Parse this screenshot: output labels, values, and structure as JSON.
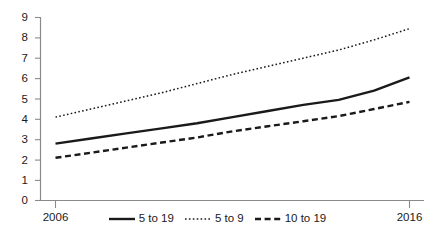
{
  "chart_data": {
    "type": "line",
    "title": "",
    "subtitle": "",
    "xlabel": "",
    "ylabel": "",
    "xlim": [
      2006,
      2016
    ],
    "ylim": [
      0,
      9
    ],
    "grid": false,
    "legend_position": "bottom-center",
    "x": [
      2006,
      2007,
      2008,
      2009,
      2010,
      2011,
      2012,
      2013,
      2014,
      2015,
      2016
    ],
    "x_tick_labels": [
      "2006",
      "2016"
    ],
    "y_tick_labels": [
      "0",
      "1",
      "2",
      "3",
      "4",
      "5",
      "6",
      "7",
      "8",
      "9"
    ],
    "y_ticks": [
      0,
      1,
      2,
      3,
      4,
      5,
      6,
      7,
      8,
      9
    ],
    "series": [
      {
        "name": "5 to 19",
        "style": "solid",
        "color": "#1a1a1a",
        "values": [
          2.8,
          3.05,
          3.3,
          3.55,
          3.8,
          4.1,
          4.4,
          4.7,
          4.95,
          5.4,
          6.05
        ]
      },
      {
        "name": "5 to 9",
        "style": "dotted",
        "color": "#1a1a1a",
        "values": [
          4.1,
          4.5,
          4.9,
          5.3,
          5.75,
          6.2,
          6.6,
          7.0,
          7.4,
          7.9,
          8.45
        ]
      },
      {
        "name": "10 to 19",
        "style": "dashed",
        "color": "#1a1a1a",
        "values": [
          2.1,
          2.35,
          2.6,
          2.85,
          3.1,
          3.4,
          3.65,
          3.9,
          4.15,
          4.5,
          4.85
        ]
      }
    ]
  },
  "axes": {
    "y_labels": [
      "9",
      "8",
      "7",
      "6",
      "5",
      "4",
      "3",
      "2",
      "1",
      "0"
    ],
    "x_labels": [
      "2006",
      "2016"
    ]
  },
  "legend": {
    "items": [
      {
        "label": "5 to 19",
        "style": "solid"
      },
      {
        "label": "5 to 9",
        "style": "dotted"
      },
      {
        "label": "10 to 19",
        "style": "dashed"
      }
    ]
  },
  "colors": {
    "series_line": "#1a1a1a",
    "axis": "#7a7a7a",
    "background": "#ffffff"
  }
}
